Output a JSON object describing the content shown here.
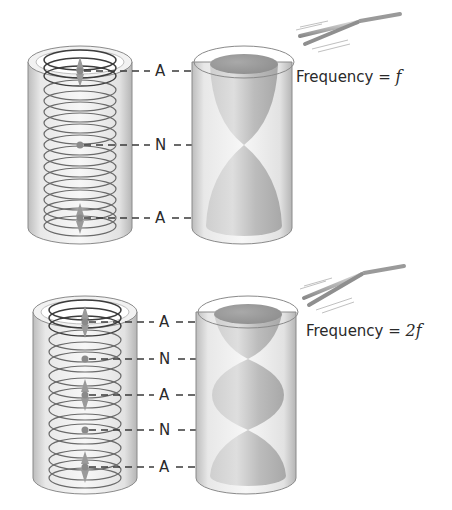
{
  "diagrams": [
    {
      "id": "fundamental",
      "frequency_label": "Frequency = ",
      "frequency_value": "f",
      "markers": [
        {
          "label": "A",
          "y": 71
        },
        {
          "label": "N",
          "y": 145
        },
        {
          "label": "A",
          "y": 218
        }
      ]
    },
    {
      "id": "second-harmonic",
      "frequency_label": "Frequency = ",
      "frequency_value": "2f",
      "markers": [
        {
          "label": "A",
          "y": 322
        },
        {
          "label": "N",
          "y": 359
        },
        {
          "label": "A",
          "y": 395
        },
        {
          "label": "N",
          "y": 430
        },
        {
          "label": "A",
          "y": 467
        }
      ]
    }
  ],
  "legend": {
    "A": "Antinode",
    "N": "Node"
  },
  "colors": {
    "tube_outline": "#8a8a8a",
    "tube_fill": "#e6e6e6",
    "coil": "#6a6a6a",
    "lobe": "#bdbdbd",
    "dash": "#3a3a3a",
    "text": "#2a2a2a"
  }
}
